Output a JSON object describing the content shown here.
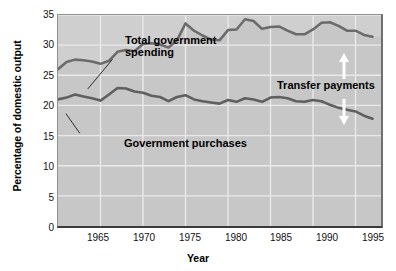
{
  "chart_data": {
    "type": "line",
    "title": "",
    "xlabel": "Year",
    "ylabel": "Percentage of domestic output",
    "xlim": [
      1960,
      1998
    ],
    "ylim": [
      0,
      35
    ],
    "yticks": [
      0,
      5,
      10,
      15,
      20,
      25,
      30,
      35
    ],
    "xticks": [
      1965,
      1970,
      1975,
      1980,
      1985,
      1990,
      1995
    ],
    "grid": true,
    "legend_position": "inline-annotations",
    "annotations": [
      "Total government spending",
      "Government purchases",
      "Transfer payments"
    ],
    "x": [
      1960,
      1961,
      1962,
      1963,
      1964,
      1965,
      1966,
      1967,
      1968,
      1969,
      1970,
      1971,
      1972,
      1973,
      1974,
      1975,
      1976,
      1977,
      1978,
      1979,
      1980,
      1981,
      1982,
      1983,
      1984,
      1985,
      1986,
      1987,
      1988,
      1989,
      1990,
      1991,
      1992,
      1993,
      1994,
      1995,
      1996,
      1997
    ],
    "series": [
      {
        "name": "Total government spending",
        "color": "#6b6b6b",
        "values": [
          26.0,
          27.2,
          27.6,
          27.5,
          27.3,
          26.9,
          27.4,
          28.9,
          29.2,
          29.0,
          30.2,
          30.3,
          30.1,
          29.6,
          30.8,
          33.6,
          32.4,
          31.6,
          30.9,
          30.8,
          32.5,
          32.6,
          34.3,
          34.0,
          32.7,
          33.0,
          33.1,
          32.4,
          31.8,
          31.8,
          32.6,
          33.7,
          33.8,
          33.2,
          32.4,
          32.4,
          31.7,
          31.4
        ]
      },
      {
        "name": "Government purchases",
        "color": "#5f5f5f",
        "values": [
          21.0,
          21.3,
          21.8,
          21.5,
          21.2,
          20.8,
          21.8,
          22.9,
          22.8,
          22.3,
          22.1,
          21.6,
          21.4,
          20.7,
          21.4,
          21.7,
          21.0,
          20.7,
          20.5,
          20.3,
          20.9,
          20.6,
          21.2,
          21.0,
          20.6,
          21.3,
          21.4,
          21.2,
          20.7,
          20.6,
          20.9,
          20.7,
          20.1,
          19.6,
          19.3,
          19.0,
          18.3,
          17.8
        ]
      }
    ]
  },
  "axes": {
    "y_title": "Percentage of domestic output",
    "x_title": "Year",
    "y_tick_labels": [
      "35",
      "30",
      "25",
      "20",
      "15",
      "10",
      "5",
      "0"
    ],
    "x_tick_labels": [
      "1965",
      "1970",
      "1975",
      "1980",
      "1985",
      "1990",
      "1995"
    ]
  },
  "labels": {
    "total_spending_line1": "Total government",
    "total_spending_line2": "spending",
    "government_purchases": "Government purchases",
    "transfer_payments": "Transfer payments"
  },
  "colors": {
    "plot_background": "#c7c7c7",
    "plot_background_upper": "#cfcfcf",
    "gridline": "#eaeaea",
    "line_total_spending": "#6b6b6b",
    "line_government_purchases": "#5f5f5f",
    "arrow": "#ffffff",
    "text": "#000000",
    "page_background": "#ffffff"
  }
}
